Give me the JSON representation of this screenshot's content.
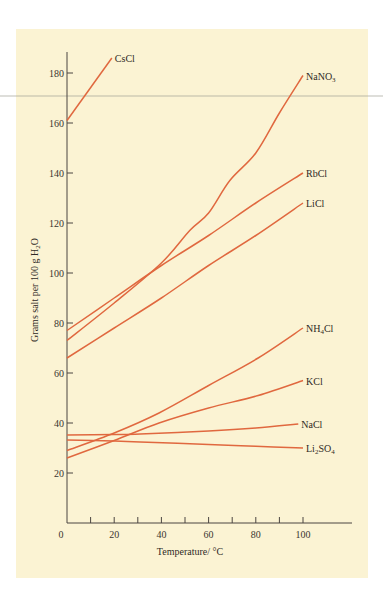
{
  "chart_data": {
    "type": "line",
    "title": "",
    "xlabel": "Temperature/ °C",
    "ylabel": "Grams salt per 100 g H2O",
    "ylabel_parts": {
      "main": "Grams salt per 100 g H",
      "sub": "2",
      "tail": "O"
    },
    "xlim": [
      0,
      120
    ],
    "ylim": [
      0,
      190
    ],
    "xticks": [
      0,
      20,
      40,
      60,
      80,
      100
    ],
    "xticks_minor": [
      10,
      30,
      50,
      70,
      90
    ],
    "yticks": [
      20,
      40,
      60,
      80,
      100,
      120,
      140,
      160,
      180
    ],
    "grid": false,
    "legend": "inline labels at line ends",
    "line_color": "#e0683f",
    "series": [
      {
        "name": "CsCl",
        "label_parts": [
          {
            "t": "CsCl"
          }
        ],
        "x": [
          0,
          19
        ],
        "y": [
          161,
          186
        ]
      },
      {
        "name": "NaNO3",
        "label_parts": [
          {
            "t": "NaNO"
          },
          {
            "t": "3",
            "sub": true
          }
        ],
        "x": [
          0,
          20,
          40,
          52,
          60,
          69,
          80,
          90,
          100
        ],
        "y": [
          73,
          88,
          104,
          117,
          124,
          137,
          148,
          164,
          179
        ]
      },
      {
        "name": "RbCl",
        "label_parts": [
          {
            "t": "RbCl"
          }
        ],
        "x": [
          0,
          20,
          40,
          60,
          80,
          100
        ],
        "y": [
          77,
          90,
          103,
          115,
          128,
          140
        ]
      },
      {
        "name": "LiCl",
        "label_parts": [
          {
            "t": "LiCl"
          }
        ],
        "x": [
          0,
          20,
          40,
          60,
          80,
          100
        ],
        "y": [
          66,
          78,
          90,
          103,
          115,
          128
        ]
      },
      {
        "name": "NH4Cl",
        "label_parts": [
          {
            "t": "NH"
          },
          {
            "t": "4",
            "sub": true
          },
          {
            "t": "Cl"
          }
        ],
        "x": [
          0,
          20,
          39,
          60,
          81,
          100
        ],
        "y": [
          29,
          36,
          44,
          55,
          66,
          78
        ]
      },
      {
        "name": "KCl",
        "label_parts": [
          {
            "t": "KCl"
          }
        ],
        "x": [
          0,
          20,
          39,
          60,
          81,
          100
        ],
        "y": [
          26,
          33,
          40,
          46,
          51,
          57
        ]
      },
      {
        "name": "NaCl",
        "label_parts": [
          {
            "t": "NaCl"
          }
        ],
        "x": [
          0,
          20,
          31,
          60,
          80,
          98
        ],
        "y": [
          35.2,
          35.4,
          35.6,
          36.8,
          38,
          39.6
        ]
      },
      {
        "name": "Li2SO4",
        "label_parts": [
          {
            "t": "Li"
          },
          {
            "t": "2",
            "sub": true
          },
          {
            "t": "SO"
          },
          {
            "t": "4",
            "sub": true
          }
        ],
        "x": [
          0,
          20,
          31,
          60,
          80,
          100
        ],
        "y": [
          33.2,
          32.8,
          32.4,
          31.4,
          30.7,
          30
        ]
      }
    ]
  }
}
